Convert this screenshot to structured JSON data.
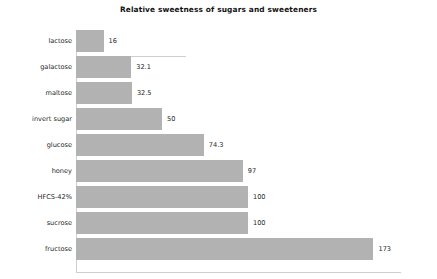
{
  "chart_data": {
    "type": "bar",
    "orientation": "horizontal",
    "title": "Relative sweetness of sugars and sweeteners",
    "xlabel": "",
    "ylabel": "",
    "grid": false,
    "legend": false,
    "xlim": [
      0,
      189
    ],
    "categories": [
      "lactose",
      "galactose",
      "maltose",
      "invert sugar",
      "glucose",
      "honey",
      "HFCS-42%",
      "sucrose",
      "fructose"
    ],
    "values": [
      16,
      32.1,
      32.5,
      50,
      74.3,
      97,
      100,
      100,
      173
    ],
    "value_labels": [
      "16",
      "32.1",
      "32.5",
      "50",
      "74.3",
      "97",
      "100",
      "100",
      "173"
    ],
    "bar_color": "#b2b2b2",
    "axis_color": "#cfcfcf",
    "background": "#ffffff"
  }
}
